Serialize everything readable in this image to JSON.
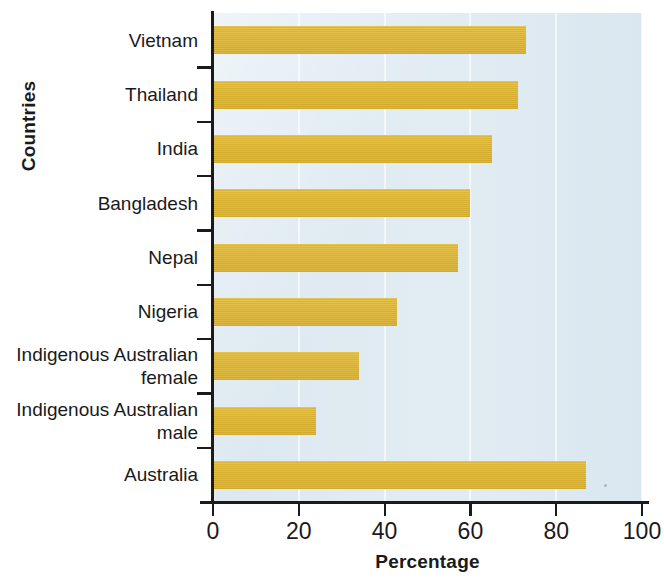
{
  "chart_data": {
    "type": "bar",
    "orientation": "horizontal",
    "title": "",
    "xlabel": "Percentage",
    "ylabel": "Countries",
    "categories": [
      "Vietnam",
      "Thailand",
      "India",
      "Bangladesh",
      "Nepal",
      "Nigeria",
      "Indigenous Australian\nfemale",
      "Indigenous Australian\nmale",
      "Australia"
    ],
    "values": [
      73,
      71,
      65,
      60,
      57,
      43,
      34,
      24,
      87
    ],
    "xlim": [
      0,
      100
    ],
    "xticks": [
      0,
      20,
      40,
      60,
      80,
      100
    ],
    "xticklabels": [
      "0",
      "20",
      "40",
      "60",
      "80",
      "100"
    ],
    "grid": "vertical-faint",
    "legend": "none",
    "bar_color": "#ddb531",
    "plot_background": "#dde9f1",
    "axis_color": "#1b1b1b",
    "text_color": "#1a1a1a"
  }
}
